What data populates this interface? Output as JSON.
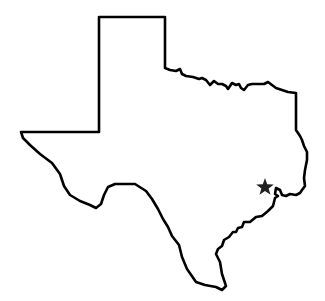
{
  "map": {
    "subject": "Texas state outline",
    "region": "Texas",
    "marker": {
      "type": "star-icon",
      "location_label": "Houston area (near Galveston Bay)",
      "color": "#222222"
    },
    "outline_color": "#000000",
    "background_color": "#ffffff"
  }
}
